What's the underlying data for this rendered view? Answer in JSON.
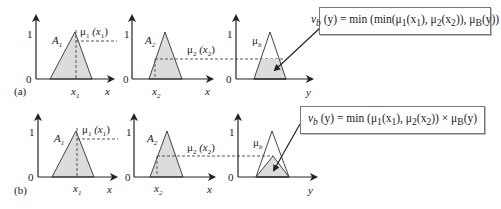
{
  "panels": [
    {
      "id": "a",
      "label": "(a)",
      "formula": "ν_b (y) = min (min(μ1(x1), μ2(x2)), μb(y))",
      "formula_parts": {
        "lhs": "v",
        "lhs_sub": "b",
        "lhs_arg": " (y) = min (min(μ",
        "t1_sub": "1",
        "t1_arg_a": "(x",
        "t1_arg_sub": "1",
        "t2": "), μ",
        "t2_sub": "2",
        "t2_arg_a": "(x",
        "t2_arg_sub": "2",
        "t3": ")), μ",
        "t3_sub": "B",
        "t3_end": "(y))"
      },
      "method": "min-clipping"
    },
    {
      "id": "b",
      "label": "(b)",
      "formula": "ν_b (y) = min (μ1(x1), μ2(x2)) × μb(y)",
      "formula_parts": {
        "lhs": "v",
        "lhs_sub": "b",
        "lhs_arg": " (y) = min (μ",
        "t1_sub": "1",
        "t1_arg_a": "(x",
        "t1_arg_sub": "1",
        "t2": "), μ",
        "t2_sub": "2",
        "t2_arg_a": "(x",
        "t2_arg_sub": "2",
        "t3": ")) ×  μ",
        "t3_sub": "B",
        "t3_end": "(y)"
      },
      "method": "product-scaling"
    }
  ],
  "axes": {
    "one": "1",
    "zero": "0",
    "x": "x",
    "y": "y"
  },
  "sets": {
    "A1": "A",
    "A1_sub": "1",
    "A2": "A",
    "A2_sub": "2",
    "mu_b": "μ",
    "mu_b_sub": "b",
    "mu1": "μ",
    "mu1_sub": "1",
    "mu1_arg": " (x",
    "mu1_arg_sub": "1",
    "mu2": "μ",
    "mu2_sub": "2",
    "mu2_arg": " (x",
    "mu2_arg_sub": "2",
    "x1": "x",
    "x1_sub": "1",
    "x2": "x",
    "x2_sub": "2"
  },
  "colors": {
    "fill": "#dcdcdc",
    "line": "#444444",
    "dash": "#555555"
  }
}
